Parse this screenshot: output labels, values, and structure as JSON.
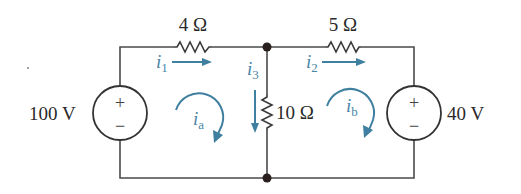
{
  "circuit": {
    "sources": [
      {
        "id": "left",
        "value": "100 V",
        "plus": "+",
        "minus": "−"
      },
      {
        "id": "right",
        "value": "40 V",
        "plus": "+",
        "minus": "−"
      }
    ],
    "resistors": [
      {
        "id": "r4",
        "label": "4 Ω"
      },
      {
        "id": "r5",
        "label": "5 Ω"
      },
      {
        "id": "r10",
        "label": "10 Ω"
      }
    ],
    "branch_currents": [
      {
        "id": "i1",
        "symbol": "i",
        "sub": "1"
      },
      {
        "id": "i2",
        "symbol": "i",
        "sub": "2"
      },
      {
        "id": "i3",
        "symbol": "i",
        "sub": "3"
      }
    ],
    "mesh_currents": [
      {
        "id": "ia",
        "symbol": "i",
        "sub": "a"
      },
      {
        "id": "ib",
        "symbol": "i",
        "sub": "b"
      }
    ],
    "colors": {
      "wire": "#4a4a4a",
      "current": "#4a86a8",
      "node": "#2a1f1f"
    }
  }
}
